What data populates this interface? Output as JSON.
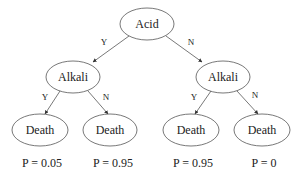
{
  "diagram": {
    "type": "decision-tree",
    "nodes": [
      {
        "id": "acid",
        "label": "Acid",
        "cx": 147,
        "cy": 24,
        "rx": 27,
        "ry": 16
      },
      {
        "id": "alkali-left",
        "label": "Alkali",
        "cx": 73,
        "cy": 77,
        "rx": 27,
        "ry": 16
      },
      {
        "id": "alkali-right",
        "label": "Alkali",
        "cx": 223,
        "cy": 77,
        "rx": 27,
        "ry": 16
      },
      {
        "id": "death-1",
        "label": "Death",
        "cx": 40,
        "cy": 130,
        "rx": 28,
        "ry": 16
      },
      {
        "id": "death-2",
        "label": "Death",
        "cx": 110,
        "cy": 130,
        "rx": 27,
        "ry": 16
      },
      {
        "id": "death-3",
        "label": "Death",
        "cx": 191,
        "cy": 130,
        "rx": 28,
        "ry": 16
      },
      {
        "id": "death-4",
        "label": "Death",
        "cx": 262,
        "cy": 130,
        "rx": 28,
        "ry": 16
      }
    ],
    "edges": [
      {
        "from": "acid",
        "to": "alkali-left",
        "label": "Y",
        "x1": 129,
        "y1": 36,
        "x2": 93,
        "y2": 62,
        "lx": 104,
        "ly": 42
      },
      {
        "from": "acid",
        "to": "alkali-right",
        "label": "N",
        "x1": 166,
        "y1": 36,
        "x2": 202,
        "y2": 62,
        "lx": 191,
        "ly": 42
      },
      {
        "from": "alkali-left",
        "to": "death-1",
        "label": "Y",
        "x1": 60,
        "y1": 91,
        "x2": 45,
        "y2": 114,
        "lx": 45,
        "ly": 97
      },
      {
        "from": "alkali-left",
        "to": "death-2",
        "label": "N",
        "x1": 88,
        "y1": 91,
        "x2": 108,
        "y2": 114,
        "lx": 106,
        "ly": 97
      },
      {
        "from": "alkali-right",
        "to": "death-3",
        "label": "Y",
        "x1": 211,
        "y1": 91,
        "x2": 195,
        "y2": 114,
        "lx": 194,
        "ly": 97
      },
      {
        "from": "alkali-right",
        "to": "death-4",
        "label": "N",
        "x1": 237,
        "y1": 91,
        "x2": 258,
        "y2": 114,
        "lx": 255,
        "ly": 95
      }
    ],
    "probabilities": [
      {
        "label": "P = 0.05",
        "x": 42,
        "y": 163
      },
      {
        "label": "P = 0.95",
        "x": 113,
        "y": 163
      },
      {
        "label": "P = 0.95",
        "x": 193,
        "y": 163
      },
      {
        "label": "P = 0",
        "x": 264,
        "y": 163
      }
    ]
  }
}
